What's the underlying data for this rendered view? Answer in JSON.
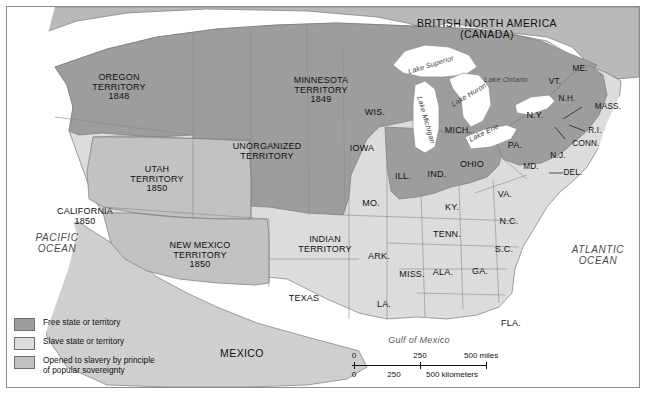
{
  "map": {
    "title_regions": {
      "canada": "BRITISH NORTH AMERICA\n(CANADA)",
      "canada_line1": "BRITISH NORTH AMERICA",
      "canada_line2": "(CANADA)",
      "mexico": "MEXICO"
    },
    "oceans": [
      {
        "name": "pacific-ocean-label",
        "line1": "PACIFIC",
        "line2": "OCEAN",
        "x": 50,
        "y": 237
      },
      {
        "name": "atlantic-ocean-label",
        "line1": "ATLANTIC",
        "line2": "OCEAN",
        "x": 591,
        "y": 249
      },
      {
        "name": "gulf-of-mexico-label",
        "line1": "Gulf of Mexico",
        "x": 412,
        "y": 334
      }
    ],
    "lakes": [
      {
        "label": "Lake Superior",
        "x": 424,
        "y": 58,
        "rot": -17
      },
      {
        "label": "Lake Michigan",
        "x": 419,
        "y": 113,
        "rot": 74
      },
      {
        "label": "Lake Huron",
        "x": 460,
        "y": 88,
        "rot": -31
      },
      {
        "label": "Lake Ontario",
        "x": 499,
        "y": 73,
        "rot": 0
      },
      {
        "label": "Lake Erie",
        "x": 477,
        "y": 126,
        "rot": -26
      }
    ],
    "territories": [
      {
        "name": "oregon-territory",
        "lines": [
          "OREGON",
          "TERRITORY",
          "1848"
        ],
        "x": 112,
        "y": 81,
        "status": "free"
      },
      {
        "name": "utah-territory",
        "lines": [
          "UTAH",
          "TERRITORY",
          "1850"
        ],
        "x": 150,
        "y": 173,
        "status": "popular_sovereignty"
      },
      {
        "name": "california-state",
        "lines": [
          "CALIFORNIA",
          "1850"
        ],
        "x": 78,
        "y": 210,
        "status": "free"
      },
      {
        "name": "new-mexico-territory",
        "lines": [
          "NEW MEXICO",
          "TERRITORY",
          "1850"
        ],
        "x": 193,
        "y": 249,
        "status": "popular_sovereignty"
      },
      {
        "name": "minnesota-territory",
        "lines": [
          "MINNESOTA",
          "TERRITORY",
          "1849"
        ],
        "x": 314,
        "y": 84,
        "status": "free"
      },
      {
        "name": "unorganized-territory",
        "lines": [
          "UNORGANIZED",
          "TERRITORY"
        ],
        "x": 260,
        "y": 145,
        "status": "free"
      },
      {
        "name": "indian-territory",
        "lines": [
          "INDIAN",
          "TERRITORY"
        ],
        "x": 318,
        "y": 238,
        "status": "slave"
      }
    ],
    "states": [
      {
        "name": "wisconsin",
        "label": "WIS.",
        "x": 368,
        "y": 106,
        "status": "free"
      },
      {
        "name": "michigan",
        "label": "MICH.",
        "x": 451,
        "y": 124,
        "status": "free"
      },
      {
        "name": "iowa",
        "label": "IOWA",
        "x": 355,
        "y": 142,
        "status": "free"
      },
      {
        "name": "illinois",
        "label": "ILL.",
        "x": 396,
        "y": 170,
        "status": "free"
      },
      {
        "name": "indiana",
        "label": "IND.",
        "x": 430,
        "y": 168,
        "status": "free"
      },
      {
        "name": "ohio",
        "label": "OHIO",
        "x": 465,
        "y": 158,
        "status": "free"
      },
      {
        "name": "pennsylvania",
        "label": "PA.",
        "x": 508,
        "y": 139,
        "status": "free"
      },
      {
        "name": "new-york",
        "label": "N.Y.",
        "x": 528,
        "y": 109,
        "status": "free"
      },
      {
        "name": "vermont",
        "label": "VT.",
        "x": 548,
        "y": 75,
        "status": "free"
      },
      {
        "name": "new-hampshire",
        "label": "N.H.",
        "x": 560,
        "y": 92,
        "status": "free"
      },
      {
        "name": "maine",
        "label": "ME.",
        "x": 573,
        "y": 62,
        "status": "free"
      },
      {
        "name": "massachusetts",
        "label": "MASS.",
        "x": 601,
        "y": 100,
        "status": "free"
      },
      {
        "name": "rhode-island",
        "label": "R.I.",
        "x": 588,
        "y": 124,
        "status": "free"
      },
      {
        "name": "connecticut",
        "label": "CONN.",
        "x": 579,
        "y": 137,
        "status": "free"
      },
      {
        "name": "new-jersey",
        "label": "N.J.",
        "x": 551,
        "y": 149,
        "status": "free"
      },
      {
        "name": "delaware",
        "label": "DEL.",
        "x": 566,
        "y": 166,
        "status": "slave"
      },
      {
        "name": "maryland",
        "label": "MD.",
        "x": 524,
        "y": 160,
        "status": "slave"
      },
      {
        "name": "virginia",
        "label": "VA.",
        "x": 498,
        "y": 188,
        "status": "slave"
      },
      {
        "name": "kentucky",
        "label": "KY.",
        "x": 445,
        "y": 201,
        "status": "slave"
      },
      {
        "name": "missouri",
        "label": "MO.",
        "x": 364,
        "y": 197,
        "status": "slave"
      },
      {
        "name": "tennessee",
        "label": "TENN.",
        "x": 440,
        "y": 228,
        "status": "slave"
      },
      {
        "name": "north-carolina",
        "label": "N.C.",
        "x": 502,
        "y": 215,
        "status": "slave"
      },
      {
        "name": "south-carolina",
        "label": "S.C.",
        "x": 497,
        "y": 243,
        "status": "slave"
      },
      {
        "name": "arkansas",
        "label": "ARK.",
        "x": 372,
        "y": 250,
        "status": "slave"
      },
      {
        "name": "mississippi",
        "label": "MISS.",
        "x": 405,
        "y": 268,
        "status": "slave"
      },
      {
        "name": "alabama",
        "label": "ALA.",
        "x": 436,
        "y": 266,
        "status": "slave"
      },
      {
        "name": "georgia",
        "label": "GA.",
        "x": 473,
        "y": 265,
        "status": "slave"
      },
      {
        "name": "louisiana",
        "label": "LA.",
        "x": 377,
        "y": 298,
        "status": "slave"
      },
      {
        "name": "texas",
        "label": "TEXAS",
        "x": 297,
        "y": 292,
        "status": "slave"
      },
      {
        "name": "florida",
        "label": "FLA.",
        "x": 504,
        "y": 317,
        "status": "slave"
      }
    ]
  },
  "legend": {
    "items": [
      {
        "name": "legend-free",
        "label": "Free state or territory",
        "color": "#9d9d9d"
      },
      {
        "name": "legend-slave",
        "label": "Slave state or territory",
        "color": "#dcdcdc"
      },
      {
        "name": "legend-popular-sovereignty",
        "label": "Opened to slavery by principle\nof popular sovereignty",
        "label_line1": "Opened to slavery by principle",
        "label_line2": "of popular sovereignty",
        "color": "#c2c2c2"
      }
    ]
  },
  "scale": {
    "miles": {
      "ticks": [
        "0",
        "250",
        "500 miles"
      ],
      "values": [
        0,
        250,
        500
      ],
      "unit": "miles"
    },
    "kilometers": {
      "ticks": [
        "0",
        "250",
        "500 kilometers"
      ],
      "values": [
        0,
        250,
        500
      ],
      "unit": "kilometers"
    }
  },
  "colors": {
    "free": "#9d9d9d",
    "slave": "#dcdcdc",
    "popular_sovereignty": "#c2c2c2",
    "canada": "#b9b9b9",
    "mexico": "#cfcfcf",
    "water": "#ffffff",
    "border": "#6e6e6e"
  }
}
